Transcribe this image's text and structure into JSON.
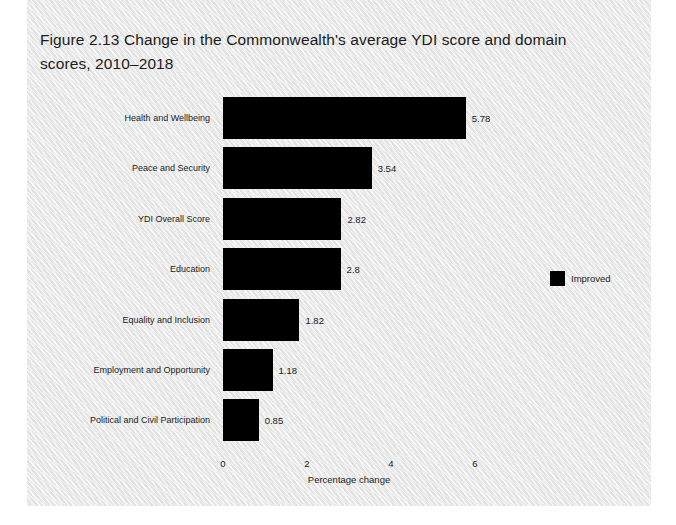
{
  "figure": {
    "title": "Figure 2.13   Change in the Commonwealth's average YDI score and domain scores, 2010–2018"
  },
  "chart_data": {
    "type": "bar",
    "orientation": "horizontal",
    "title": "Figure 2.13   Change in the Commonwealth's average YDI score and domain scores, 2010–2018",
    "categories": [
      "Health and Wellbeing",
      "Peace and Security",
      "YDI Overall Score",
      "Education",
      "Equality and Inclusion",
      "Employment and Opportunity",
      "Political and Civil Participation"
    ],
    "values": [
      5.78,
      3.54,
      2.82,
      2.8,
      1.82,
      1.18,
      0.85
    ],
    "value_labels": [
      "5.78",
      "3.54",
      "2.82",
      "2.8",
      "1.82",
      "1.18",
      "0.85"
    ],
    "series": [
      {
        "name": "Improved",
        "color": "#000000",
        "values": [
          5.78,
          3.54,
          2.82,
          2.8,
          1.82,
          1.18,
          0.85
        ]
      }
    ],
    "xlabel": "Percentage change",
    "ylabel": "",
    "xlim": [
      0,
      6.857
    ],
    "xticks": [
      0,
      2,
      4,
      6
    ],
    "xtick_labels": [
      "0",
      "2",
      "4",
      "6"
    ],
    "grid": false,
    "legend": {
      "position": "right",
      "entries": [
        {
          "label": "Improved",
          "color": "#000000"
        }
      ]
    },
    "background_color": "#f0f0f0",
    "bar_color": "#000000"
  }
}
